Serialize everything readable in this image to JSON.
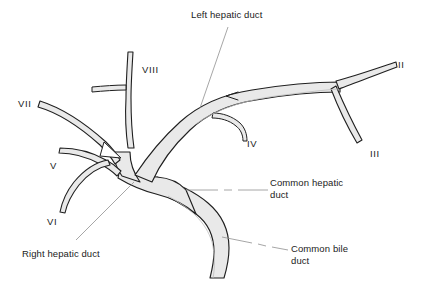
{
  "figure": {
    "kind": "anatomical-line-drawing",
    "background_color": "#ffffff",
    "duct_fill_color": "#e9e9e9",
    "duct_outline_color": "#1f1f1f",
    "leader_line_color": "#8a8a8a",
    "text_color": "#1b1b1b"
  },
  "labels": {
    "left_hepatic_duct": "Left hepatic duct",
    "right_hepatic_duct": "Right hepatic duct",
    "common_hepatic_duct_line1": "Common hepatic",
    "common_hepatic_duct_line2": "duct",
    "common_bile_duct_line1": "Common bile",
    "common_bile_duct_line2": "duct"
  },
  "segments": [
    {
      "id": "II",
      "label": "II"
    },
    {
      "id": "III",
      "label": "III"
    },
    {
      "id": "IV",
      "label": "IV"
    },
    {
      "id": "V",
      "label": "V"
    },
    {
      "id": "VI",
      "label": "VI"
    },
    {
      "id": "VII",
      "label": "VII"
    },
    {
      "id": "VIII",
      "label": "VIII"
    }
  ]
}
